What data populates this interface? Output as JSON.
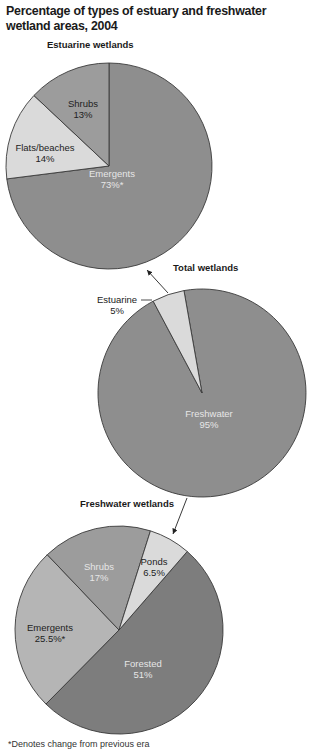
{
  "title": "Percentage of types of estuary and freshwater wetland areas, 2004",
  "footnote": "*Denotes change from previous era",
  "colors": {
    "darkest": "#7d7d7d",
    "dark": "#8e8e8e",
    "mid": "#9c9c9c",
    "light": "#b5b5b5",
    "lightest": "#dadada",
    "outline": "#3a3a3a",
    "label_on_dark": "#e6e6e6",
    "label_on_light": "#222222"
  },
  "chart_data": [
    {
      "type": "pie",
      "title": "Estuarine wetlands",
      "slices": [
        {
          "label": "Emergents",
          "value": 73,
          "display": "73%*",
          "changed": true
        },
        {
          "label": "Flats/beaches",
          "value": 14,
          "display": "14%",
          "changed": false
        },
        {
          "label": "Shrubs",
          "value": 13,
          "display": "13%",
          "changed": false
        }
      ],
      "unit": "%"
    },
    {
      "type": "pie",
      "title": "Total wetlands",
      "slices": [
        {
          "label": "Freshwater",
          "value": 95,
          "display": "95%"
        },
        {
          "label": "Estuarine",
          "value": 5,
          "display": "5%"
        }
      ],
      "unit": "%"
    },
    {
      "type": "pie",
      "title": "Freshwater wetlands",
      "slices": [
        {
          "label": "Forested",
          "value": 51,
          "display": "51%",
          "changed": false
        },
        {
          "label": "Emergents",
          "value": 25.5,
          "display": "25.5%*",
          "changed": true
        },
        {
          "label": "Shrubs",
          "value": 17,
          "display": "17%",
          "changed": false
        },
        {
          "label": "Ponds",
          "value": 6.5,
          "display": "6.5%",
          "changed": false
        }
      ],
      "unit": "%"
    }
  ]
}
